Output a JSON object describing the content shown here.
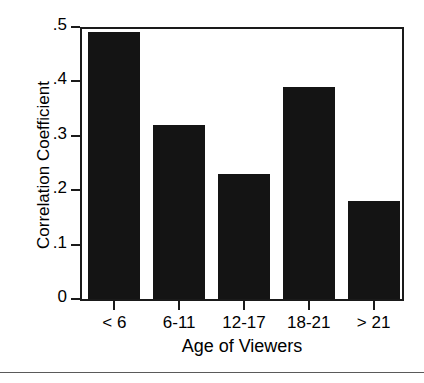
{
  "chart_data": {
    "type": "bar",
    "title": "",
    "categories": [
      "< 6",
      "6-11",
      "12-17",
      "18-21",
      "> 21"
    ],
    "values": [
      0.49,
      0.32,
      0.23,
      0.39,
      0.18
    ],
    "xlabel": "Age of Viewers",
    "ylabel": "Correlation Coefficient",
    "ylim": [
      0,
      0.5
    ],
    "ytick_labels": [
      "0",
      ".1",
      ".2",
      ".3",
      ".4",
      ".5"
    ],
    "ytick_values": [
      0,
      0.1,
      0.2,
      0.3,
      0.4,
      0.5
    ],
    "grid": false,
    "legend": false,
    "bar_color": "#141414",
    "background_color": "#ffffff",
    "axis_color": "#1a1a1a"
  }
}
